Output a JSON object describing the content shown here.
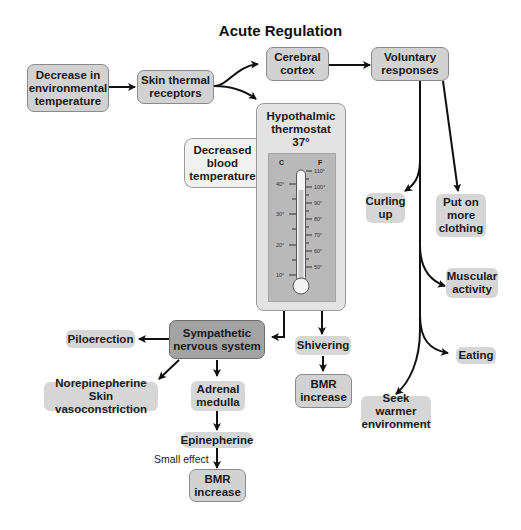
{
  "title": "Acute Regulation",
  "nodes": {
    "decrease_env_temp": "Decrease in environmental temperature",
    "skin_receptors": "Skin thermal receptors",
    "cerebral_cortex": "Cerebral cortex",
    "voluntary_responses": "Voluntary responses",
    "hypothalamic": "Hypothalmic thermostat 37°",
    "decreased_blood_temp": "Decreased blood temperature",
    "curling_up": "Curling up",
    "put_on_clothing": "Put on more clothing",
    "muscular_activity": "Muscular activity",
    "eating": "Eating",
    "seek_warmer": "Seek warmer environment",
    "sympathetic": "Sympathetic nervous system",
    "piloerection": "Piloerection",
    "norepinephrine": "Norepinepherine Skin vasoconstriction",
    "adrenal_medulla": "Adrenal medulla",
    "epinephrine": "Epinepherine",
    "bmr_increase_bottom": "BMR increase",
    "shivering": "Shivering",
    "bmr_increase_right": "BMR increase"
  },
  "lines": {
    "decrease_env_temp": [
      "Decrease in",
      "environmental",
      "temperature"
    ],
    "skin_receptors": [
      "Skin thermal",
      "receptors"
    ],
    "cerebral_cortex": [
      "Cerebral",
      "cortex"
    ],
    "voluntary_responses": [
      "Voluntary",
      "responses"
    ],
    "hypothalamic": [
      "Hypothalmic",
      "thermostat",
      "37°"
    ],
    "decreased_blood_temp": [
      "Decreased",
      "blood",
      "temperature"
    ],
    "curling_up": [
      "Curling",
      "up"
    ],
    "put_on_clothing": [
      "Put on",
      "more",
      "clothing"
    ],
    "muscular_activity": [
      "Muscular",
      "activity"
    ],
    "eating": [
      "Eating"
    ],
    "seek_warmer": [
      "Seek warmer",
      "environment"
    ],
    "sympathetic": [
      "Sympathetic",
      "nervous system"
    ],
    "piloerection": [
      "Piloerection"
    ],
    "norepinephrine": [
      "Norepinepherine",
      "Skin vasoconstriction"
    ],
    "adrenal_medulla": [
      "Adrenal",
      "medulla"
    ],
    "epinephrine": [
      "Epinepherine"
    ],
    "bmr_increase_bottom": [
      "BMR",
      "increase"
    ],
    "shivering": [
      "Shivering"
    ],
    "bmr_increase_right": [
      "BMR",
      "increase"
    ]
  },
  "annotation": "Small effect",
  "thermometer": {
    "c_label": "C",
    "f_label": "F",
    "celsius_ticks": [
      "40°",
      "30°",
      "20°",
      "10°"
    ],
    "fahrenheit_ticks": [
      "110°",
      "100°",
      "90°",
      "80°",
      "70°",
      "60°",
      "50°"
    ]
  },
  "edges": [
    {
      "from": "decrease_env_temp",
      "to": "skin_receptors"
    },
    {
      "from": "skin_receptors",
      "to": "cerebral_cortex"
    },
    {
      "from": "skin_receptors",
      "to": "hypothalamic"
    },
    {
      "from": "cerebral_cortex",
      "to": "voluntary_responses"
    },
    {
      "from": "voluntary_responses",
      "to": "curling_up"
    },
    {
      "from": "voluntary_responses",
      "to": "put_on_clothing"
    },
    {
      "from": "voluntary_responses",
      "to": "muscular_activity"
    },
    {
      "from": "voluntary_responses",
      "to": "eating"
    },
    {
      "from": "voluntary_responses",
      "to": "seek_warmer"
    },
    {
      "from": "hypothalamic",
      "to": "sympathetic"
    },
    {
      "from": "hypothalamic",
      "to": "shivering"
    },
    {
      "from": "sympathetic",
      "to": "piloerection"
    },
    {
      "from": "sympathetic",
      "to": "norepinephrine"
    },
    {
      "from": "sympathetic",
      "to": "adrenal_medulla"
    },
    {
      "from": "adrenal_medulla",
      "to": "epinephrine"
    },
    {
      "from": "epinephrine",
      "to": "bmr_increase_bottom",
      "label": "Small effect"
    },
    {
      "from": "shivering",
      "to": "bmr_increase_right"
    }
  ]
}
